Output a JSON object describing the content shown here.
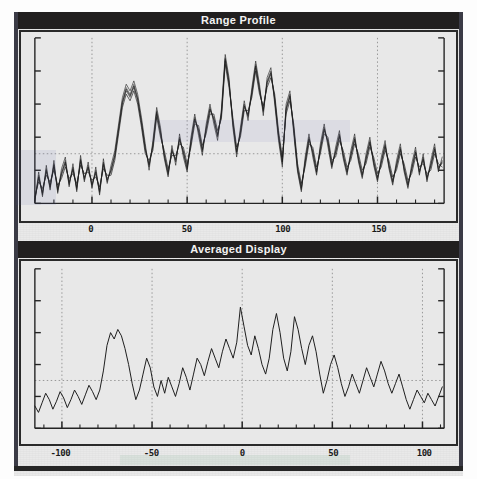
{
  "figure": {
    "background_color": "#e9e9e9",
    "frame_color": "#2a2a2a",
    "title_bar_color": "#211f1f",
    "trace_color": "#1b1b1b",
    "grid_color": "#8f8f8f"
  },
  "panels": [
    {
      "id": "range-profile",
      "title": "Range Profile"
    },
    {
      "id": "averaged-display",
      "title": "Averaged Display"
    }
  ],
  "chart_data": [
    {
      "type": "line",
      "title": "Range Profile",
      "xlabel": "",
      "ylabel": "",
      "xlim": [
        -30,
        185
      ],
      "ylim": [
        0,
        1
      ],
      "xticks": [
        0,
        50,
        100,
        150
      ],
      "xticklabels": [
        "0",
        "50",
        "100",
        "150"
      ],
      "yticks": [],
      "yticklabels": [],
      "grid": true,
      "grid_style": "dotted",
      "legend": "none",
      "n_series": 5,
      "note": "Multiple overlaid range-profile traces (repeated sweeps) drawn in dark grey/black.",
      "x": [
        -30,
        -28,
        -26,
        -24,
        -22,
        -20,
        -18,
        -16,
        -14,
        -12,
        -10,
        -8,
        -6,
        -4,
        -2,
        0,
        2,
        4,
        6,
        8,
        10,
        12,
        14,
        16,
        18,
        20,
        22,
        24,
        26,
        28,
        30,
        32,
        34,
        36,
        38,
        40,
        42,
        44,
        46,
        48,
        50,
        52,
        54,
        56,
        58,
        60,
        62,
        64,
        66,
        68,
        70,
        72,
        74,
        76,
        78,
        80,
        82,
        84,
        86,
        88,
        90,
        92,
        94,
        96,
        98,
        100,
        102,
        104,
        106,
        108,
        110,
        112,
        114,
        116,
        118,
        120,
        122,
        124,
        126,
        128,
        130,
        132,
        134,
        136,
        138,
        140,
        142,
        144,
        146,
        148,
        150,
        152,
        154,
        156,
        158,
        160,
        162,
        164,
        166,
        168,
        170,
        172,
        174,
        176,
        178,
        180,
        182,
        184
      ],
      "series": [
        {
          "name": "sweep-1",
          "values": [
            0.02,
            0.17,
            0.05,
            0.21,
            0.09,
            0.24,
            0.07,
            0.19,
            0.26,
            0.11,
            0.22,
            0.08,
            0.27,
            0.14,
            0.23,
            0.1,
            0.2,
            0.06,
            0.25,
            0.13,
            0.21,
            0.3,
            0.46,
            0.62,
            0.7,
            0.66,
            0.72,
            0.64,
            0.5,
            0.34,
            0.22,
            0.36,
            0.56,
            0.44,
            0.28,
            0.17,
            0.33,
            0.25,
            0.4,
            0.3,
            0.2,
            0.38,
            0.52,
            0.43,
            0.31,
            0.46,
            0.58,
            0.5,
            0.4,
            0.55,
            0.88,
            0.74,
            0.48,
            0.3,
            0.44,
            0.6,
            0.52,
            0.68,
            0.84,
            0.7,
            0.55,
            0.74,
            0.8,
            0.62,
            0.4,
            0.24,
            0.58,
            0.66,
            0.44,
            0.2,
            0.08,
            0.26,
            0.4,
            0.3,
            0.18,
            0.34,
            0.46,
            0.36,
            0.22,
            0.32,
            0.42,
            0.28,
            0.18,
            0.3,
            0.4,
            0.26,
            0.16,
            0.28,
            0.38,
            0.24,
            0.14,
            0.26,
            0.36,
            0.22,
            0.12,
            0.24,
            0.34,
            0.2,
            0.1,
            0.22,
            0.32,
            0.18,
            0.28,
            0.14,
            0.24,
            0.34,
            0.2,
            0.26
          ]
        },
        {
          "name": "sweep-2",
          "values": [
            0.03,
            0.15,
            0.07,
            0.19,
            0.11,
            0.22,
            0.09,
            0.17,
            0.24,
            0.13,
            0.2,
            0.1,
            0.25,
            0.16,
            0.21,
            0.12,
            0.18,
            0.08,
            0.23,
            0.15,
            0.19,
            0.28,
            0.44,
            0.6,
            0.68,
            0.64,
            0.7,
            0.62,
            0.48,
            0.32,
            0.24,
            0.34,
            0.54,
            0.42,
            0.3,
            0.19,
            0.31,
            0.27,
            0.38,
            0.32,
            0.22,
            0.36,
            0.5,
            0.45,
            0.33,
            0.44,
            0.56,
            0.52,
            0.42,
            0.53,
            0.86,
            0.72,
            0.5,
            0.32,
            0.42,
            0.58,
            0.54,
            0.66,
            0.82,
            0.68,
            0.57,
            0.72,
            0.78,
            0.64,
            0.42,
            0.26,
            0.56,
            0.64,
            0.46,
            0.22,
            0.1,
            0.24,
            0.38,
            0.32,
            0.2,
            0.32,
            0.44,
            0.38,
            0.24,
            0.3,
            0.4,
            0.3,
            0.2,
            0.28,
            0.38,
            0.28,
            0.18,
            0.26,
            0.36,
            0.26,
            0.16,
            0.24,
            0.34,
            0.24,
            0.14,
            0.22,
            0.32,
            0.22,
            0.12,
            0.2,
            0.3,
            0.2,
            0.26,
            0.16,
            0.22,
            0.32,
            0.22,
            0.24
          ]
        },
        {
          "name": "sweep-3",
          "values": [
            0.01,
            0.19,
            0.04,
            0.23,
            0.08,
            0.26,
            0.06,
            0.21,
            0.28,
            0.1,
            0.24,
            0.07,
            0.29,
            0.13,
            0.25,
            0.09,
            0.22,
            0.05,
            0.27,
            0.12,
            0.23,
            0.32,
            0.48,
            0.64,
            0.72,
            0.68,
            0.74,
            0.66,
            0.52,
            0.36,
            0.2,
            0.38,
            0.58,
            0.46,
            0.27,
            0.16,
            0.35,
            0.23,
            0.42,
            0.28,
            0.19,
            0.4,
            0.54,
            0.41,
            0.29,
            0.48,
            0.6,
            0.48,
            0.38,
            0.57,
            0.9,
            0.76,
            0.46,
            0.28,
            0.46,
            0.62,
            0.5,
            0.7,
            0.86,
            0.72,
            0.53,
            0.76,
            0.82,
            0.6,
            0.38,
            0.22,
            0.6,
            0.68,
            0.42,
            0.19,
            0.07,
            0.28,
            0.42,
            0.28,
            0.17,
            0.36,
            0.48,
            0.34,
            0.21,
            0.34,
            0.44,
            0.27,
            0.17,
            0.32,
            0.42,
            0.25,
            0.15,
            0.3,
            0.4,
            0.23,
            0.13,
            0.28,
            0.38,
            0.21,
            0.11,
            0.26,
            0.36,
            0.19,
            0.09,
            0.24,
            0.34,
            0.17,
            0.3,
            0.13,
            0.26,
            0.36,
            0.19,
            0.28
          ]
        },
        {
          "name": "sweep-4",
          "values": [
            0.04,
            0.13,
            0.09,
            0.17,
            0.13,
            0.2,
            0.11,
            0.15,
            0.22,
            0.15,
            0.18,
            0.12,
            0.23,
            0.18,
            0.19,
            0.14,
            0.16,
            0.1,
            0.21,
            0.17,
            0.17,
            0.26,
            0.42,
            0.58,
            0.66,
            0.62,
            0.68,
            0.6,
            0.46,
            0.3,
            0.26,
            0.32,
            0.52,
            0.4,
            0.32,
            0.21,
            0.29,
            0.29,
            0.36,
            0.34,
            0.24,
            0.34,
            0.48,
            0.47,
            0.35,
            0.42,
            0.54,
            0.54,
            0.44,
            0.51,
            0.84,
            0.7,
            0.52,
            0.34,
            0.4,
            0.56,
            0.56,
            0.64,
            0.8,
            0.66,
            0.59,
            0.7,
            0.76,
            0.66,
            0.44,
            0.28,
            0.54,
            0.62,
            0.48,
            0.24,
            0.12,
            0.22,
            0.36,
            0.34,
            0.22,
            0.3,
            0.42,
            0.4,
            0.26,
            0.28,
            0.38,
            0.32,
            0.22,
            0.26,
            0.36,
            0.3,
            0.2,
            0.24,
            0.34,
            0.28,
            0.18,
            0.22,
            0.32,
            0.26,
            0.16,
            0.2,
            0.3,
            0.24,
            0.14,
            0.18,
            0.28,
            0.22,
            0.24,
            0.18,
            0.2,
            0.3,
            0.24,
            0.22
          ]
        },
        {
          "name": "sweep-5",
          "values": [
            0.02,
            0.16,
            0.06,
            0.2,
            0.1,
            0.23,
            0.08,
            0.18,
            0.25,
            0.12,
            0.21,
            0.09,
            0.26,
            0.15,
            0.22,
            0.11,
            0.19,
            0.07,
            0.24,
            0.14,
            0.2,
            0.29,
            0.45,
            0.61,
            0.69,
            0.65,
            0.71,
            0.63,
            0.49,
            0.33,
            0.23,
            0.35,
            0.55,
            0.43,
            0.29,
            0.18,
            0.32,
            0.26,
            0.39,
            0.31,
            0.21,
            0.37,
            0.51,
            0.44,
            0.32,
            0.45,
            0.57,
            0.51,
            0.41,
            0.54,
            0.87,
            0.73,
            0.49,
            0.31,
            0.43,
            0.59,
            0.53,
            0.67,
            0.83,
            0.69,
            0.56,
            0.73,
            0.79,
            0.63,
            0.41,
            0.25,
            0.57,
            0.65,
            0.45,
            0.21,
            0.09,
            0.25,
            0.39,
            0.31,
            0.19,
            0.33,
            0.45,
            0.37,
            0.23,
            0.31,
            0.41,
            0.29,
            0.19,
            0.29,
            0.39,
            0.27,
            0.17,
            0.27,
            0.37,
            0.25,
            0.15,
            0.25,
            0.35,
            0.23,
            0.13,
            0.23,
            0.33,
            0.21,
            0.11,
            0.21,
            0.31,
            0.19,
            0.27,
            0.15,
            0.23,
            0.33,
            0.21,
            0.25
          ]
        }
      ]
    },
    {
      "type": "line",
      "title": "Averaged Display",
      "xlabel": "",
      "ylabel": "",
      "xlim": [
        -115,
        112
      ],
      "ylim": [
        0,
        1
      ],
      "xticks": [
        -100,
        -50,
        0,
        50,
        100
      ],
      "xticklabels": [
        "-100",
        "-50",
        "0",
        "50",
        "100"
      ],
      "yticks": [],
      "yticklabels": [],
      "grid": true,
      "grid_style": "dotted",
      "legend": "none",
      "n_series": 1,
      "note": "Single averaged trace, smoother than the individual sweeps above.",
      "x": [
        -115,
        -113,
        -111,
        -109,
        -107,
        -105,
        -103,
        -101,
        -99,
        -97,
        -95,
        -93,
        -91,
        -89,
        -87,
        -85,
        -83,
        -81,
        -79,
        -77,
        -75,
        -73,
        -71,
        -69,
        -67,
        -65,
        -63,
        -61,
        -59,
        -57,
        -55,
        -53,
        -51,
        -49,
        -47,
        -45,
        -43,
        -41,
        -39,
        -37,
        -35,
        -33,
        -31,
        -29,
        -27,
        -25,
        -23,
        -21,
        -19,
        -17,
        -15,
        -13,
        -11,
        -9,
        -7,
        -5,
        -3,
        -1,
        1,
        3,
        5,
        7,
        9,
        11,
        13,
        15,
        17,
        19,
        21,
        23,
        25,
        27,
        29,
        31,
        33,
        35,
        37,
        39,
        41,
        43,
        45,
        47,
        49,
        51,
        53,
        55,
        57,
        59,
        61,
        63,
        65,
        67,
        69,
        71,
        73,
        75,
        77,
        79,
        81,
        83,
        85,
        87,
        89,
        91,
        93,
        95,
        97,
        99,
        101,
        103,
        105,
        107,
        109,
        111
      ],
      "series": [
        {
          "name": "averaged",
          "values": [
            0.14,
            0.1,
            0.16,
            0.22,
            0.18,
            0.12,
            0.17,
            0.23,
            0.19,
            0.13,
            0.18,
            0.24,
            0.2,
            0.15,
            0.21,
            0.27,
            0.23,
            0.18,
            0.24,
            0.36,
            0.52,
            0.6,
            0.56,
            0.62,
            0.58,
            0.5,
            0.4,
            0.28,
            0.18,
            0.24,
            0.34,
            0.44,
            0.38,
            0.26,
            0.2,
            0.3,
            0.22,
            0.32,
            0.26,
            0.2,
            0.28,
            0.38,
            0.32,
            0.24,
            0.34,
            0.44,
            0.4,
            0.33,
            0.42,
            0.5,
            0.44,
            0.38,
            0.48,
            0.56,
            0.5,
            0.44,
            0.54,
            0.76,
            0.64,
            0.52,
            0.46,
            0.58,
            0.5,
            0.4,
            0.34,
            0.44,
            0.62,
            0.72,
            0.6,
            0.44,
            0.36,
            0.48,
            0.7,
            0.62,
            0.5,
            0.4,
            0.52,
            0.58,
            0.48,
            0.34,
            0.22,
            0.3,
            0.4,
            0.46,
            0.38,
            0.28,
            0.2,
            0.26,
            0.34,
            0.28,
            0.22,
            0.3,
            0.38,
            0.32,
            0.26,
            0.34,
            0.42,
            0.36,
            0.28,
            0.22,
            0.28,
            0.34,
            0.26,
            0.18,
            0.12,
            0.18,
            0.24,
            0.2,
            0.16,
            0.22,
            0.18,
            0.14,
            0.2,
            0.26,
            0.22,
            0.28
          ]
        }
      ]
    }
  ]
}
